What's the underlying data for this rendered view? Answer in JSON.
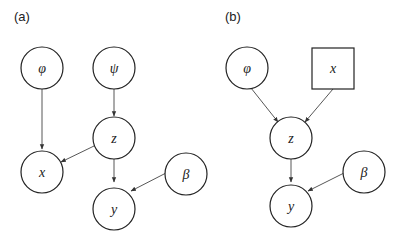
{
  "panels": [
    {
      "label": "(a)",
      "nodes": [
        {
          "id": "phi",
          "label": "φ",
          "shape": "circle"
        },
        {
          "id": "psi",
          "label": "ψ",
          "shape": "circle"
        },
        {
          "id": "z",
          "label": "z",
          "shape": "circle"
        },
        {
          "id": "x",
          "label": "x",
          "shape": "circle"
        },
        {
          "id": "y",
          "label": "y",
          "shape": "circle"
        },
        {
          "id": "beta",
          "label": "β",
          "shape": "circle"
        }
      ],
      "edges": [
        {
          "from": "phi",
          "to": "x"
        },
        {
          "from": "psi",
          "to": "z"
        },
        {
          "from": "z",
          "to": "x"
        },
        {
          "from": "z",
          "to": "y"
        },
        {
          "from": "beta",
          "to": "y"
        }
      ]
    },
    {
      "label": "(b)",
      "nodes": [
        {
          "id": "phi",
          "label": "φ",
          "shape": "circle"
        },
        {
          "id": "x",
          "label": "x",
          "shape": "square"
        },
        {
          "id": "z",
          "label": "z",
          "shape": "circle"
        },
        {
          "id": "y",
          "label": "y",
          "shape": "circle"
        },
        {
          "id": "beta",
          "label": "β",
          "shape": "circle"
        }
      ],
      "edges": [
        {
          "from": "phi",
          "to": "z"
        },
        {
          "from": "x",
          "to": "z"
        },
        {
          "from": "z",
          "to": "y"
        },
        {
          "from": "beta",
          "to": "y"
        }
      ]
    }
  ]
}
